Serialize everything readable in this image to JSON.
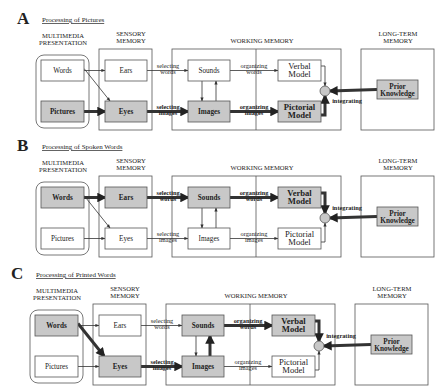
{
  "colors": {
    "highlight_fill": "#c8c8c8",
    "plain_fill": "#ffffff",
    "ink": "#222222",
    "circle_fill": "#c8c8c8"
  },
  "headers": {
    "multimedia": [
      "MULTIMEDIA",
      "PRESENTATION"
    ],
    "sensory": [
      "SENSORY",
      "MEMORY"
    ],
    "working": "WORKING MEMORY",
    "longterm": [
      "LONG-TERM",
      "MEMORY"
    ]
  },
  "node_labels": {
    "words": "Words",
    "pictures": "Pictures",
    "ears": "Ears",
    "eyes": "Eyes",
    "sounds": "Sounds",
    "images": "Images",
    "verbal": [
      "Verbal",
      "Model"
    ],
    "pictorial": [
      "Pictorial",
      "Model"
    ],
    "prior": [
      "Prior",
      "Knowledge"
    ]
  },
  "edge_labels": {
    "selecting_words": [
      "selecting",
      "words"
    ],
    "selecting_images": [
      "selecting",
      "images"
    ],
    "organizing_words": [
      "organizing",
      "words"
    ],
    "organizing_images": [
      "organizing",
      "images"
    ],
    "integrating": "integrating"
  },
  "panels": [
    {
      "letter": "A",
      "title": "Processing of Pictures",
      "highlighted_nodes": [
        "pictures",
        "eyes",
        "images",
        "pictorial",
        "prior"
      ],
      "bold_paths": [
        "pictures-eyes",
        "eyes-images",
        "images-pictorial",
        "pictorial-circle",
        "prior-circle"
      ],
      "bold_edge_labels": [
        "selecting_images",
        "organizing_images",
        "integrating"
      ]
    },
    {
      "letter": "B",
      "title": "Processing of Spoken Words",
      "highlighted_nodes": [
        "words",
        "ears",
        "sounds",
        "verbal",
        "prior"
      ],
      "bold_paths": [
        "words-ears",
        "ears-sounds",
        "sounds-verbal",
        "verbal-circle",
        "prior-circle"
      ],
      "bold_edge_labels": [
        "selecting_words",
        "organizing_words",
        "integrating"
      ]
    },
    {
      "letter": "C",
      "title": "Processing of Printed Words",
      "highlighted_nodes": [
        "words",
        "eyes",
        "sounds",
        "images",
        "verbal",
        "prior"
      ],
      "bold_paths": [
        "words-eyes",
        "eyes-images",
        "images-sounds",
        "sounds-verbal",
        "verbal-circle",
        "prior-circle"
      ],
      "bold_edge_labels": [
        "selecting_images",
        "organizing_words",
        "integrating"
      ]
    }
  ]
}
